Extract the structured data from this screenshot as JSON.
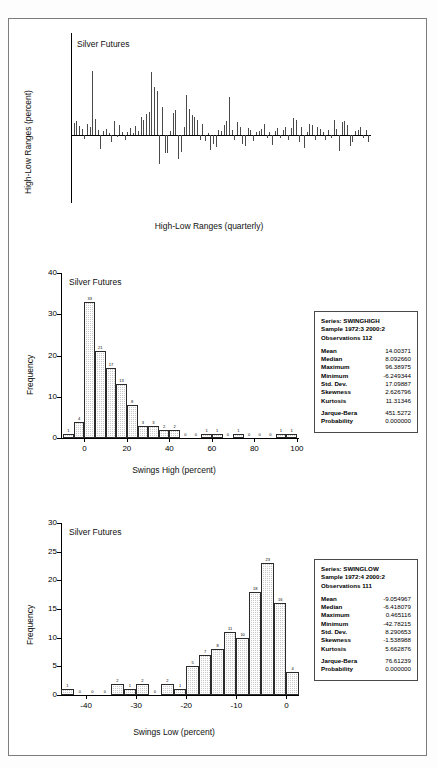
{
  "figure": {
    "background": "#ffffff",
    "border_color": "#7c7c7c",
    "bar_fill": "#c9c9c9",
    "bar_edge": "#2b2b2b",
    "series_color": "#4a4a4a"
  },
  "chart_data": [
    {
      "id": "high-low-ranges",
      "type": "bar",
      "title": "Silver Futures",
      "xlabel": "High-Low Ranges (quarterly)",
      "ylabel": "High-Low Ranges (percent)",
      "xlim": [
        1972.5,
        2000.5
      ],
      "ylim": [
        -100,
        150
      ],
      "yticks": [
        -100,
        -50,
        0,
        50,
        100,
        150
      ],
      "xticks": [
        75,
        80,
        85,
        90,
        95,
        100
      ],
      "xticklabels": [
        "75",
        "80",
        "85",
        "90",
        "95",
        "00"
      ],
      "grid": false,
      "legend": "none",
      "x": [
        1972.75,
        1973.0,
        1973.25,
        1973.5,
        1973.75,
        1974.0,
        1974.25,
        1974.5,
        1974.75,
        1975.0,
        1975.25,
        1975.5,
        1975.75,
        1976.0,
        1976.25,
        1976.5,
        1976.75,
        1977.0,
        1977.25,
        1977.5,
        1977.75,
        1978.0,
        1978.25,
        1978.5,
        1978.75,
        1979.0,
        1979.25,
        1979.5,
        1979.75,
        1980.0,
        1980.25,
        1980.5,
        1980.75,
        1981.0,
        1981.25,
        1981.5,
        1981.75,
        1982.0,
        1982.25,
        1982.5,
        1982.75,
        1983.0,
        1983.25,
        1983.5,
        1983.75,
        1984.0,
        1984.25,
        1984.5,
        1984.75,
        1985.0,
        1985.25,
        1985.5,
        1985.75,
        1986.0,
        1986.25,
        1986.5,
        1986.75,
        1987.0,
        1987.25,
        1987.5,
        1987.75,
        1988.0,
        1988.25,
        1988.5,
        1988.75,
        1989.0,
        1989.25,
        1989.5,
        1989.75,
        1990.0,
        1990.25,
        1990.5,
        1990.75,
        1991.0,
        1991.25,
        1991.5,
        1991.75,
        1992.0,
        1992.25,
        1992.5,
        1992.75,
        1993.0,
        1993.25,
        1993.5,
        1993.75,
        1994.0,
        1994.25,
        1994.5,
        1994.75,
        1995.0,
        1995.25,
        1995.5,
        1995.75,
        1996.0,
        1996.25,
        1996.5,
        1996.75,
        1997.0,
        1997.25,
        1997.5,
        1997.75,
        1998.0,
        1998.25,
        1998.5,
        1998.75,
        1999.0,
        1999.25,
        1999.5,
        1999.75,
        2000.0,
        2000.25,
        2000.5
      ],
      "values": [
        18,
        21,
        13,
        9,
        -6,
        16,
        12,
        94,
        24,
        8,
        -20,
        6,
        9,
        3,
        -11,
        20,
        -3,
        14,
        4,
        -8,
        5,
        10,
        3,
        13,
        6,
        26,
        22,
        31,
        34,
        92,
        71,
        65,
        -42,
        41,
        -26,
        -26,
        6,
        33,
        37,
        -35,
        -25,
        12,
        59,
        38,
        30,
        27,
        22,
        -7,
        16,
        -9,
        3,
        -22,
        -13,
        -18,
        7,
        6,
        15,
        21,
        56,
        7,
        -8,
        19,
        12,
        -13,
        -16,
        11,
        8,
        -9,
        4,
        6,
        9,
        16,
        -5,
        4,
        -14,
        6,
        10,
        -5,
        7,
        12,
        -8,
        11,
        25,
        22,
        -11,
        12,
        -19,
        5,
        16,
        14,
        -7,
        12,
        9,
        5,
        -8,
        7,
        -5,
        22,
        9,
        -23,
        19,
        21,
        14,
        -16,
        -10,
        6,
        8,
        12,
        -4,
        7,
        -11,
        5
      ]
    },
    {
      "id": "swings-high-histogram",
      "type": "bar",
      "title": "Silver Futures",
      "xlabel": "Swings High (percent)",
      "ylabel": "Frequency",
      "xlim": [
        -11,
        101
      ],
      "ylim": [
        0,
        40
      ],
      "yticks": [
        0,
        10,
        20,
        30,
        40
      ],
      "xticks": [
        0,
        20,
        40,
        60,
        80,
        100
      ],
      "xticklabels": [
        "0",
        "20",
        "40",
        "60",
        "80",
        "100"
      ],
      "grid": false,
      "legend": "none",
      "bin_width": 5,
      "bin_starts": [
        -10,
        -5,
        0,
        5,
        10,
        15,
        20,
        25,
        30,
        35,
        40,
        45,
        50,
        55,
        60,
        65,
        70,
        75,
        80,
        85,
        90,
        95
      ],
      "values": [
        1,
        4,
        33,
        21,
        17,
        13,
        8,
        3,
        3,
        2,
        2,
        0,
        0,
        1,
        1,
        0,
        1,
        0,
        0,
        0,
        1,
        1
      ]
    },
    {
      "id": "swings-low-histogram",
      "type": "bar",
      "title": "Silver Futures",
      "xlabel": "Swings Low (percent)",
      "ylabel": "Frequency",
      "xlim": [
        -45,
        2.5
      ],
      "ylim": [
        0,
        30
      ],
      "yticks": [
        0,
        5,
        10,
        15,
        20,
        25,
        30
      ],
      "xticks": [
        -40,
        -30,
        -20,
        -10,
        0
      ],
      "xticklabels": [
        "-40",
        "-30",
        "-20",
        "-10",
        "0"
      ],
      "grid": false,
      "legend": "none",
      "bin_width": 2.5,
      "bin_starts": [
        -45,
        -42.5,
        -40,
        -37.5,
        -35,
        -32.5,
        -30,
        -27.5,
        -25,
        -22.5,
        -20,
        -17.5,
        -15,
        -12.5,
        -10,
        -7.5,
        -5,
        -2.5,
        0
      ],
      "values": [
        1,
        0,
        0,
        0,
        2,
        1,
        2,
        0,
        2,
        1,
        5,
        7,
        8,
        11,
        10,
        18,
        23,
        16,
        4
      ]
    }
  ],
  "stats_boxes": [
    {
      "id": "swinghigh-stats",
      "header": [
        "Series: SWINGHIGH",
        "Sample 1972:3 2000:2",
        "Observations 112"
      ],
      "rows": [
        {
          "key": "Mean",
          "value": "14.00371"
        },
        {
          "key": "Median",
          "value": "8.092660"
        },
        {
          "key": "Maximum",
          "value": "96.38975"
        },
        {
          "key": "Minimum",
          "value": "-6.249344"
        },
        {
          "key": "Std. Dev.",
          "value": "17.09887"
        },
        {
          "key": "Skewness",
          "value": "2.626796"
        },
        {
          "key": "Kurtosis",
          "value": "11.31346"
        }
      ],
      "footer": [
        {
          "key": "Jarque-Bera",
          "value": "451.5272"
        },
        {
          "key": "Probability",
          "value": "0.000000"
        }
      ]
    },
    {
      "id": "swinglow-stats",
      "header": [
        "Series: SWINGLOW",
        "Sample 1972:4 2000:2",
        "Observations 111"
      ],
      "rows": [
        {
          "key": "Mean",
          "value": "-9.054967"
        },
        {
          "key": "Median",
          "value": "-6.418079"
        },
        {
          "key": "Maximum",
          "value": "0.465116"
        },
        {
          "key": "Minimum",
          "value": "-42.78215"
        },
        {
          "key": "Std. Dev.",
          "value": "8.290653"
        },
        {
          "key": "Skewness",
          "value": "-1.538988"
        },
        {
          "key": "Kurtosis",
          "value": "5.662876"
        }
      ],
      "footer": [
        {
          "key": "Jarque-Bera",
          "value": "76.61239"
        },
        {
          "key": "Probability",
          "value": "0.000000"
        }
      ]
    }
  ]
}
